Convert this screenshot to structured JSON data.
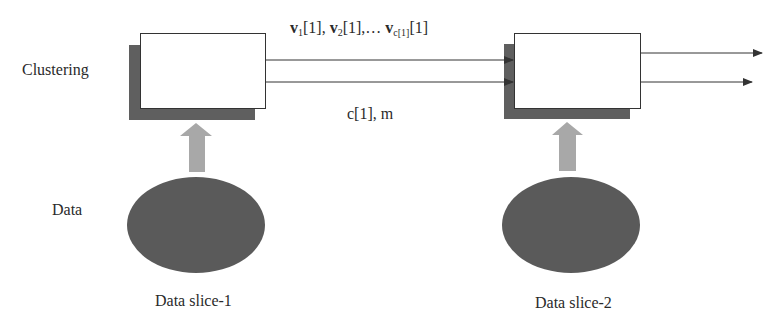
{
  "diagram": {
    "row_labels": {
      "clustering": "Clustering",
      "data": "Data"
    },
    "stages": [
      {
        "name": "clustering-block-1",
        "input_label": "Data slice-1"
      },
      {
        "name": "clustering-block-2",
        "input_label": "Data slice-2"
      }
    ],
    "edge_labels": {
      "top": {
        "v": "v",
        "s1": "1",
        "t1": "[1], ",
        "s2": "2",
        "t2": "[1],… ",
        "sc": "c[1]",
        "tc": "[1]"
      },
      "bottom": "c[1], m"
    },
    "colors": {
      "box_fill": "#ffffff",
      "box_stroke": "#333333",
      "shadow": "#5f5f5f",
      "ellipse": "#5a5a5a",
      "block_arrow": "#a8a8a8",
      "line": "#333333"
    }
  }
}
